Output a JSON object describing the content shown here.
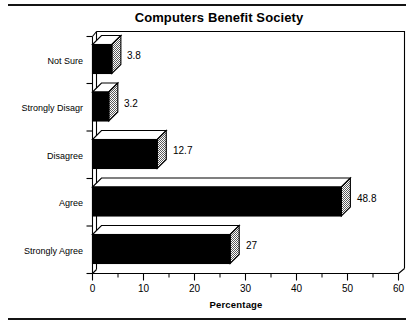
{
  "page": {
    "rules": [
      "top-rule",
      "bottom-rule"
    ]
  },
  "chart_data": {
    "type": "bar",
    "orientation": "horizontal",
    "style": "3d",
    "title": "Computers Benefit Society",
    "xlabel": "Percentage",
    "ylabel": "",
    "categories": [
      "Strongly Agree",
      "Agree",
      "Disagree",
      "Strongly Disagr",
      "Not Sure"
    ],
    "values": [
      27,
      48.8,
      12.7,
      3.2,
      3.8
    ],
    "value_labels": [
      "27",
      "48.8",
      "12.7",
      "3.2",
      "3.8"
    ],
    "xlim": [
      0,
      60
    ],
    "xticks": [
      0,
      10,
      20,
      30,
      40,
      50,
      60
    ],
    "xtick_labels": [
      "0",
      "10",
      "20",
      "30",
      "40",
      "50",
      "60"
    ],
    "minor_tick_step": 5,
    "grid": false,
    "legend": null,
    "colors": {
      "bar_front": "#000000",
      "bar_top": "#ffffff",
      "bar_side": "#9a9a9a",
      "axis": "#000000",
      "background": "#ffffff"
    }
  }
}
